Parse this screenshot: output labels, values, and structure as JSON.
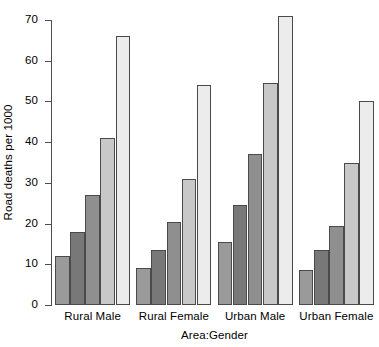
{
  "chart_data": {
    "type": "bar",
    "title": "",
    "subtitle": "",
    "xlabel": "Area:Gender",
    "ylabel": "Road deaths per 1000",
    "categories": [
      "Rural Male",
      "Rural Female",
      "Urban Male",
      "Urban Female"
    ],
    "series": [
      {
        "name": "series-1",
        "color": "#9a9a9a",
        "values": [
          12,
          9,
          15.5,
          8.5
        ]
      },
      {
        "name": "series-2",
        "color": "#787878",
        "values": [
          18,
          13.5,
          24.5,
          13.5
        ]
      },
      {
        "name": "series-3",
        "color": "#8f8f8f",
        "values": [
          27,
          20.5,
          37,
          19.5
        ]
      },
      {
        "name": "series-4",
        "color": "#c8c8c8",
        "values": [
          41,
          31,
          54.5,
          35
        ]
      },
      {
        "name": "series-5",
        "color": "#ececec",
        "values": [
          66,
          54,
          71,
          50
        ]
      }
    ],
    "ylim": [
      0,
      70
    ],
    "yticks": [
      0,
      10,
      20,
      30,
      40,
      50,
      60,
      70
    ],
    "ytick_labels": [
      "0",
      "10",
      "20",
      "30",
      "40",
      "50",
      "60",
      "70"
    ],
    "grid": false,
    "legend": "none",
    "axis_color": "#4d4d4d",
    "bar_border_color": "#4a4a4a",
    "background": "#ffffff"
  }
}
